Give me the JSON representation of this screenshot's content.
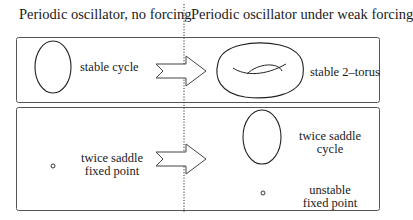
{
  "headers": {
    "left": "Periodic oscillator, no forcing",
    "right": "Periodic oscillator under weak forcing"
  },
  "rows": [
    {
      "left_label": "stable cycle",
      "right_label": "stable 2–torus"
    },
    {
      "left_label_line1": "twice saddle",
      "left_label_line2": "fixed point",
      "right_top_line1": "twice saddle",
      "right_top_line2": "cycle",
      "right_bottom_line1": "unstable",
      "right_bottom_line2": "fixed point"
    }
  ]
}
